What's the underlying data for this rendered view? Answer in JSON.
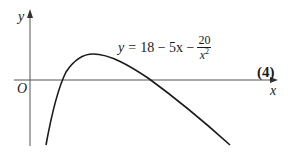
{
  "figure": {
    "y_axis_label": "y",
    "x_axis_label": "x",
    "origin_label": "O",
    "equation": {
      "lhs": "y",
      "equals": "=",
      "terms": "18 − 5x −",
      "fraction_numerator": "20",
      "fraction_denominator": "x",
      "fraction_denominator_power": "2"
    },
    "marks": "(4)"
  },
  "colors": {
    "curve": "#1a1a1a",
    "axes": "#555555"
  }
}
